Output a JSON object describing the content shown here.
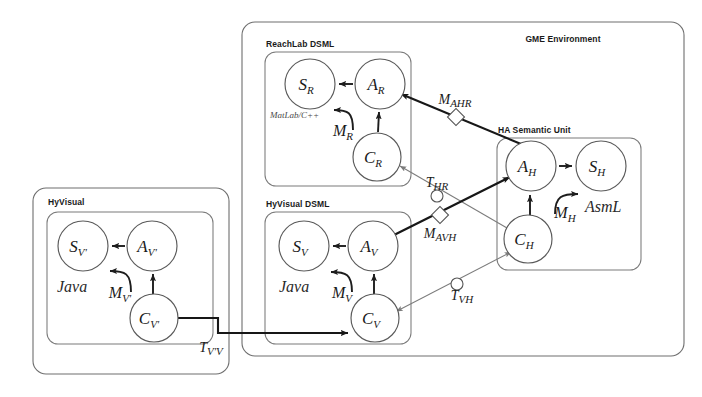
{
  "figure": {
    "type": "model-integration-diagram",
    "width": 702,
    "height": 397,
    "background": "#ffffff"
  },
  "containers": {
    "gme": {
      "label": "GME Environment",
      "x": 242,
      "y": 22,
      "w": 442,
      "h": 334
    },
    "hyvisual_outer": {
      "label": "HyVisual",
      "x": 33,
      "y": 188,
      "w": 196,
      "h": 186
    },
    "hyvisual_inner": {
      "label": "",
      "x": 47,
      "y": 212,
      "w": 166,
      "h": 132
    },
    "reachlab_dsml": {
      "label": "ReachLab DSML",
      "x": 265,
      "y": 52,
      "w": 146,
      "h": 134
    },
    "hyvisual_dsml": {
      "label": "HyVisual DSML",
      "x": 265,
      "y": 212,
      "w": 146,
      "h": 132
    },
    "ha_semantic_unit": {
      "label": "HA Semantic Unit",
      "x": 497,
      "y": 138,
      "w": 144,
      "h": 132
    }
  },
  "nodes": [
    {
      "id": "S_R",
      "base": "S",
      "sub": "R",
      "cx": 310,
      "cy": 84,
      "r": 25
    },
    {
      "id": "A_R",
      "base": "A",
      "sub": "R",
      "cx": 380,
      "cy": 84,
      "r": 25
    },
    {
      "id": "C_R",
      "base": "C",
      "sub": "R",
      "cx": 377,
      "cy": 157,
      "r": 24
    },
    {
      "id": "S_V",
      "base": "S",
      "sub": "V",
      "cx": 304,
      "cy": 246,
      "r": 25
    },
    {
      "id": "A_V",
      "base": "A",
      "sub": "V",
      "cx": 373,
      "cy": 246,
      "r": 25
    },
    {
      "id": "C_V",
      "base": "C",
      "sub": "V",
      "cx": 375,
      "cy": 318,
      "r": 24
    },
    {
      "id": "S_Vp",
      "base": "S",
      "sub": "V'",
      "cx": 83,
      "cy": 246,
      "r": 25
    },
    {
      "id": "A_Vp",
      "base": "A",
      "sub": "V'",
      "cx": 152,
      "cy": 246,
      "r": 25
    },
    {
      "id": "C_Vp",
      "base": "C",
      "sub": "V'",
      "cx": 154,
      "cy": 318,
      "r": 24
    },
    {
      "id": "A_H",
      "base": "A",
      "sub": "H",
      "cx": 531,
      "cy": 166,
      "r": 25
    },
    {
      "id": "S_H",
      "base": "S",
      "sub": "H",
      "cx": 601,
      "cy": 166,
      "r": 25
    },
    {
      "id": "C_H",
      "base": "C",
      "sub": "H",
      "cx": 528,
      "cy": 239,
      "r": 24
    }
  ],
  "language_labels": [
    {
      "id": "matlab",
      "text": "MatLab/C++",
      "x": 270,
      "y": 118,
      "size": "small"
    },
    {
      "id": "java_v",
      "text": "Java",
      "x": 279,
      "y": 287,
      "size": "large"
    },
    {
      "id": "java_vp",
      "text": "Java",
      "x": 57,
      "y": 287,
      "size": "large"
    },
    {
      "id": "asml",
      "text": "AsmL",
      "x": 585,
      "y": 206,
      "size": "large"
    }
  ],
  "mapping_labels": [
    {
      "id": "M_R",
      "base": "M",
      "sub": "R",
      "x": 343,
      "y": 130
    },
    {
      "id": "M_V",
      "base": "M",
      "sub": "V",
      "x": 342,
      "y": 292
    },
    {
      "id": "M_Vp",
      "base": "M",
      "sub": "V'",
      "x": 120,
      "y": 292
    },
    {
      "id": "M_H",
      "base": "M",
      "sub": "H",
      "x": 565,
      "y": 212
    }
  ],
  "transformations": [
    {
      "id": "M_AHR",
      "base": "M",
      "sub": "AHR",
      "marker": "diamond",
      "label_x": 463,
      "label_y": 103,
      "marker_x": 456,
      "marker_y": 117,
      "bold": true
    },
    {
      "id": "T_HR",
      "base": "T",
      "sub": "HR",
      "marker": "circle",
      "label_x": 436,
      "label_y": 184,
      "marker_x": 437,
      "marker_y": 196,
      "bold": false
    },
    {
      "id": "M_AVH",
      "base": "M",
      "sub": "AVH",
      "marker": "diamond",
      "label_x": 430,
      "label_y": 234,
      "marker_x": 440,
      "marker_y": 215,
      "bold": true
    },
    {
      "id": "T_VH",
      "base": "T",
      "sub": "VH",
      "marker": "circle",
      "label_x": 456,
      "label_y": 297,
      "marker_x": 457,
      "marker_y": 284,
      "bold": false
    },
    {
      "id": "T_VpV",
      "base": "T",
      "sub": "V'V",
      "marker": "none",
      "label_x": 211,
      "label_y": 349,
      "marker_x": 0,
      "marker_y": 0,
      "bold": false
    }
  ],
  "edges": [
    {
      "id": "AR-to-SR",
      "from": "A_R",
      "to": "S_R",
      "style": "mid",
      "arrow": "end"
    },
    {
      "id": "CR-to-AR",
      "from": "C_R",
      "to": "A_R",
      "style": "mid",
      "arrow": "end"
    },
    {
      "id": "AV-to-SV",
      "from": "A_V",
      "to": "S_V",
      "style": "mid",
      "arrow": "end"
    },
    {
      "id": "CV-to-AV",
      "from": "C_V",
      "to": "A_V",
      "style": "mid",
      "arrow": "end"
    },
    {
      "id": "AVp-to-SVp",
      "from": "A_Vp",
      "to": "S_Vp",
      "style": "mid",
      "arrow": "end"
    },
    {
      "id": "CVp-to-AVp",
      "from": "C_Vp",
      "to": "A_Vp",
      "style": "mid",
      "arrow": "end"
    },
    {
      "id": "AH-to-SH",
      "from": "A_H",
      "to": "S_H",
      "style": "mid",
      "arrow": "end"
    },
    {
      "id": "CH-to-AH",
      "from": "C_H",
      "to": "A_H",
      "style": "mid",
      "arrow": "end"
    },
    {
      "id": "CVp-to-CV",
      "from": "C_Vp",
      "to": "C_V",
      "style": "bold",
      "arrow": "end"
    },
    {
      "id": "AH-to-AR",
      "from": "A_H",
      "to": "A_R",
      "style": "bold",
      "arrow": "end"
    },
    {
      "id": "AV-to-AH",
      "from": "A_V",
      "to": "A_H",
      "style": "bold",
      "arrow": "end"
    },
    {
      "id": "CH-to-CR",
      "from": "C_H",
      "to": "C_R",
      "style": "thin",
      "arrow": "end"
    },
    {
      "id": "CV-to-CH",
      "from": "C_V",
      "to": "C_H",
      "style": "thin",
      "arrow": "end"
    }
  ]
}
